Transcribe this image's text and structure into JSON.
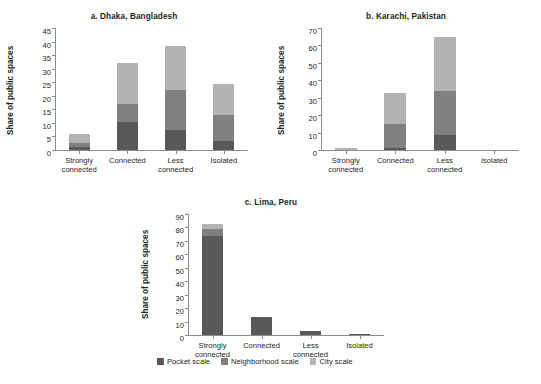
{
  "figure": {
    "series_colors": {
      "pocket": "#595959",
      "neighborhood": "#808080",
      "city": "#b3b3b3"
    },
    "axis_color": "#8c8c8c"
  },
  "legend": {
    "position": "bottom-center",
    "items": [
      {
        "label": "Pocket scale",
        "color": "#595959"
      },
      {
        "label": "Neighborhood scale",
        "color": "#808080"
      },
      {
        "label": "City scale",
        "color": "#b3b3b3"
      }
    ]
  },
  "chart_data": [
    {
      "type": "bar",
      "title": "a. Dhaka, Bangladesh",
      "xlabel": "",
      "ylabel": "Share of public spaces",
      "stacked": true,
      "grid": false,
      "ylim": [
        0,
        45
      ],
      "ytick_step": 5,
      "yticks": [
        0,
        5,
        10,
        15,
        20,
        25,
        30,
        35,
        40,
        45
      ],
      "categories": [
        "Strongly connected",
        "Connected",
        "Less connected",
        "Isolated"
      ],
      "series": [
        {
          "name": "Pocket scale",
          "values": [
            1.0,
            10.5,
            7.5,
            3.5
          ]
        },
        {
          "name": "Neighborhood scale",
          "values": [
            1.5,
            6.5,
            14.5,
            9.5
          ]
        },
        {
          "name": "City scale",
          "values": [
            3.5,
            15.0,
            16.5,
            11.5
          ]
        }
      ],
      "totals": [
        6.0,
        32.0,
        38.5,
        24.5
      ]
    },
    {
      "type": "bar",
      "title": "b. Karachi, Pakistan",
      "xlabel": "",
      "ylabel": "Share of public spaces",
      "stacked": true,
      "grid": false,
      "ylim": [
        0,
        70
      ],
      "ytick_step": 10,
      "yticks": [
        0,
        10,
        20,
        30,
        40,
        50,
        60,
        70
      ],
      "categories": [
        "Strongly connected",
        "Connected",
        "Less connected",
        "Isolated"
      ],
      "series": [
        {
          "name": "Pocket scale",
          "values": [
            0.0,
            1.2,
            8.5,
            0.0
          ]
        },
        {
          "name": "Neighborhood scale",
          "values": [
            0.0,
            13.8,
            25.5,
            0.0
          ]
        },
        {
          "name": "City scale",
          "values": [
            1.2,
            18.0,
            31.0,
            0.0
          ]
        }
      ],
      "totals": [
        1.2,
        33.0,
        65.0,
        0.0
      ]
    },
    {
      "type": "bar",
      "title": "c. Lima, Peru",
      "xlabel": "",
      "ylabel": "Share of public spaces",
      "stacked": true,
      "grid": false,
      "ylim": [
        0,
        90
      ],
      "ytick_step": 10,
      "yticks": [
        0,
        10,
        20,
        30,
        40,
        50,
        60,
        70,
        80,
        90
      ],
      "categories": [
        "Strongly connected",
        "Connected",
        "Less connected",
        "Isolated"
      ],
      "series": [
        {
          "name": "Pocket scale",
          "values": [
            74.0,
            13.5,
            3.0,
            0.5
          ]
        },
        {
          "name": "Neighborhood scale",
          "values": [
            5.0,
            0.0,
            0.0,
            0.0
          ]
        },
        {
          "name": "City scale",
          "values": [
            3.5,
            0.0,
            0.0,
            0.0
          ]
        }
      ],
      "totals": [
        82.5,
        13.5,
        3.0,
        0.5
      ]
    }
  ]
}
